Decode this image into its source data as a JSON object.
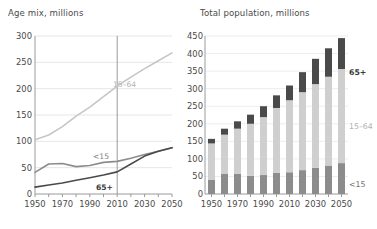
{
  "left": {
    "title": "Age mix, millions",
    "y_ticks": [
      0,
      50,
      100,
      150,
      200,
      250,
      300
    ],
    "x_ticks_labeled": [
      "1950",
      "1970",
      "1990",
      "2010",
      "2030",
      "2050"
    ],
    "series_labels": {
      "working": "15–64",
      "young": "<15",
      "old": "65+"
    },
    "marker_year": "2010",
    "colors": {
      "working": "#c6c6c6",
      "young": "#8c8c8c",
      "old": "#4a4a4a",
      "grid": "#e6e6e6",
      "axis": "#9a9a9a"
    }
  },
  "right": {
    "title": "Total population, millions",
    "y_ticks": [
      0,
      50,
      100,
      150,
      200,
      250,
      300,
      350,
      400,
      450
    ],
    "x_ticks_labeled": [
      "1950",
      "1970",
      "1990",
      "2010",
      "2030",
      "2050"
    ],
    "series_labels": {
      "old": "65+",
      "working": "15–64",
      "young": "<15"
    },
    "colors": {
      "young": "#8c8c8c",
      "working": "#cfcfcf",
      "old": "#4a4a4a",
      "grid": "#ededed",
      "axis": "#9a9a9a"
    }
  },
  "chart_data": [
    {
      "type": "line",
      "title": "Age mix, millions",
      "xlabel": "",
      "ylabel": "millions",
      "x": [
        1950,
        1960,
        1970,
        1980,
        1990,
        2000,
        2010,
        2020,
        2030,
        2040,
        2050
      ],
      "xlim": [
        1950,
        2050
      ],
      "ylim": [
        0,
        300
      ],
      "yticks": [
        0,
        50,
        100,
        150,
        200,
        250,
        300
      ],
      "xticks": [
        1950,
        1960,
        1970,
        1980,
        1990,
        2000,
        2010,
        2020,
        2030,
        2040,
        2050
      ],
      "xticklabels": [
        "1950",
        "",
        "1970",
        "",
        "1990",
        "",
        "2010",
        "",
        "2030",
        "",
        "2050"
      ],
      "grid": "horizontal",
      "legend": "inline-annotations",
      "annotations": [
        {
          "text": "15–64",
          "x": 1995,
          "y": 200
        },
        {
          "text": "<15",
          "x": 1998,
          "y": 68
        },
        {
          "text": "65+",
          "x": 2005,
          "y": 25
        },
        {
          "text": "2010 reference line",
          "x": 2010,
          "y": null
        }
      ],
      "series": [
        {
          "name": "15–64",
          "color": "#c6c6c6",
          "values": [
            103,
            112,
            128,
            148,
            165,
            185,
            205,
            222,
            238,
            253,
            268
          ]
        },
        {
          "name": "<15",
          "color": "#8c8c8c",
          "values": [
            41,
            57,
            58,
            52,
            54,
            60,
            62,
            68,
            75,
            81,
            88
          ]
        },
        {
          "name": "65+",
          "color": "#4a4a4a",
          "values": [
            13,
            17,
            21,
            26,
            31,
            36,
            42,
            57,
            72,
            81,
            88
          ]
        }
      ]
    },
    {
      "type": "bar",
      "stacked": true,
      "title": "Total population, millions",
      "xlabel": "",
      "ylabel": "millions",
      "categories": [
        "1950",
        "1960",
        "1970",
        "1980",
        "1990",
        "2000",
        "2010",
        "2020",
        "2030",
        "2040",
        "2050"
      ],
      "xticklabels": [
        "1950",
        "",
        "1970",
        "",
        "1990",
        "",
        "2010",
        "",
        "2030",
        "",
        "2050"
      ],
      "ylim": [
        0,
        450
      ],
      "yticks": [
        0,
        50,
        100,
        150,
        200,
        250,
        300,
        350,
        400,
        450
      ],
      "grid": "horizontal",
      "legend": "right-side-annotations",
      "annotations": [
        {
          "text": "65+",
          "position": "right-upper"
        },
        {
          "text": "15–64",
          "position": "right-middle"
        },
        {
          "text": "<15",
          "position": "right-lower"
        }
      ],
      "series": [
        {
          "name": "<15",
          "color": "#8c8c8c",
          "values": [
            41,
            57,
            58,
            52,
            54,
            60,
            62,
            68,
            75,
            81,
            88
          ]
        },
        {
          "name": "15–64",
          "color": "#cfcfcf",
          "values": [
            103,
            112,
            128,
            148,
            165,
            185,
            205,
            222,
            238,
            253,
            268
          ]
        },
        {
          "name": "65+",
          "color": "#4a4a4a",
          "values": [
            13,
            17,
            21,
            26,
            31,
            36,
            42,
            57,
            72,
            81,
            88
          ]
        }
      ],
      "totals": [
        157,
        186,
        207,
        226,
        250,
        281,
        309,
        347,
        385,
        415,
        444
      ]
    }
  ]
}
